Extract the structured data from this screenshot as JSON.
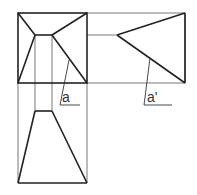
{
  "diagram": {
    "type": "orthographic-projection",
    "views": [
      "front",
      "side",
      "top"
    ],
    "labels": {
      "a": "a",
      "a_prime": "a'"
    },
    "colors": {
      "outline": "#222222",
      "construction": "#555555",
      "background": "#ffffff"
    }
  }
}
